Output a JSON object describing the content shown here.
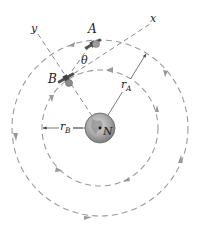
{
  "diagram": {
    "labels": {
      "satellite_a": "A",
      "satellite_b": "B",
      "x_axis": "x",
      "y_axis": "y",
      "angle": "θ",
      "radius_a_main": "r",
      "radius_a_sub": "A",
      "radius_b_main": "r",
      "radius_b_sub": "B",
      "earth_pole": "N"
    },
    "geometry": {
      "earth_center": [
        100,
        128
      ],
      "earth_radius": 15,
      "orbit_a_radius": 88,
      "orbit_b_radius": 58,
      "satellite_a_position": [
        93,
        44
      ],
      "satellite_b_position": [
        67,
        78
      ],
      "orbit_direction": "counterclockwise"
    },
    "colors": {
      "orbit_stroke": "#9a9a9a",
      "earth_fill": "#b5b5b5",
      "satellite_fill": "#6e6e6e",
      "text": "#222222"
    }
  }
}
